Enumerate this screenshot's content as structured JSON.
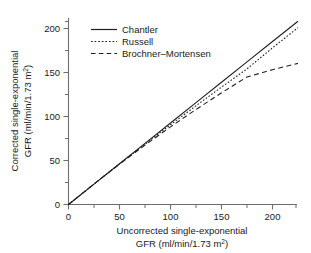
{
  "figure": {
    "background_color": "#ffffff",
    "ink_color": "#1f1f1f",
    "axis_color": "#6e6e6e"
  },
  "axes": {
    "x": {
      "title_line1": "Uncorrected single-exponential",
      "title_line2_prefix": "GFR (ml/min/1.73 m",
      "title_line2_sup": "2",
      "title_line2_suffix": ")",
      "tick_labels": [
        "0",
        "50",
        "100",
        "150",
        "200"
      ],
      "tick_values": [
        0,
        50,
        100,
        150,
        200
      ],
      "minor_tick_values": [
        25,
        75,
        125,
        175,
        225
      ],
      "range": [
        0,
        228
      ]
    },
    "y": {
      "title_line1": "Corrected single-exponential",
      "title_line2_prefix": "GFR (ml/min/1.73 m",
      "title_line2_sup": "2",
      "title_line2_suffix": ")",
      "tick_labels": [
        "0",
        "50",
        "100",
        "150",
        "200"
      ],
      "tick_values": [
        0,
        50,
        100,
        150,
        200
      ],
      "minor_tick_values": [
        25,
        75,
        125,
        175,
        215
      ],
      "range": [
        0,
        215
      ]
    }
  },
  "legend": {
    "position": "top-left-inside",
    "entries": [
      {
        "label": "Chantler",
        "style": "solid"
      },
      {
        "label": "Russell",
        "style": "dotted"
      },
      {
        "label": "Brochner–Mortensen",
        "style": "dashed"
      }
    ]
  },
  "chart_data": {
    "type": "line",
    "title": "",
    "subtitle": "",
    "xlabel": "Uncorrected single-exponential GFR (ml/min/1.73 m2)",
    "ylabel": "Corrected single-exponential GFR (ml/min/1.73 m2)",
    "xlim": [
      0,
      228
    ],
    "ylim": [
      0,
      215
    ],
    "grid": false,
    "legend_position": "upper left",
    "x": [
      0,
      25,
      50,
      75,
      100,
      125,
      150,
      175,
      200,
      225
    ],
    "series": [
      {
        "name": "Chantler",
        "style": "solid",
        "color": "#1f1f1f",
        "values": [
          0,
          23.1,
          46.3,
          69.4,
          92.6,
          115.7,
          138.9,
          162.0,
          185.2,
          208.3
        ]
      },
      {
        "name": "Russell",
        "style": "dotted",
        "color": "#1f1f1f",
        "values": [
          0,
          23.3,
          46.2,
          68.6,
          90.6,
          112.2,
          133.4,
          154.1,
          178.0,
          201.0
        ]
      },
      {
        "name": "Brochner–Mortensen",
        "style": "dashed",
        "color": "#1f1f1f",
        "values": [
          0,
          23.4,
          45.9,
          67.5,
          88.2,
          108.0,
          126.9,
          144.9,
          153.2,
          160.4
        ]
      }
    ]
  }
}
